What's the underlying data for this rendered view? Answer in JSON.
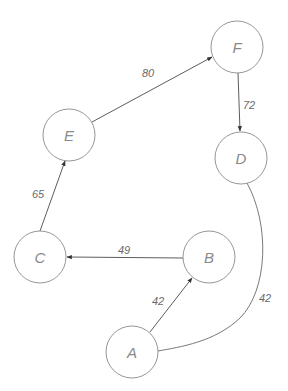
{
  "diagram": {
    "type": "weighted-graph",
    "nodes": [
      {
        "id": "A",
        "label": "A",
        "x": 132,
        "y": 352
      },
      {
        "id": "B",
        "label": "B",
        "x": 209,
        "y": 257
      },
      {
        "id": "C",
        "label": "C",
        "x": 40,
        "y": 257
      },
      {
        "id": "D",
        "label": "D",
        "x": 241,
        "y": 158
      },
      {
        "id": "E",
        "label": "E",
        "x": 69,
        "y": 135
      },
      {
        "id": "F",
        "label": "F",
        "x": 237,
        "y": 47
      }
    ],
    "edges": [
      {
        "from": "A",
        "to": "B",
        "weight": "42",
        "directed": true
      },
      {
        "from": "B",
        "to": "C",
        "weight": "49",
        "directed": true
      },
      {
        "from": "C",
        "to": "E",
        "weight": "65",
        "directed": true
      },
      {
        "from": "E",
        "to": "F",
        "weight": "80",
        "directed": true
      },
      {
        "from": "F",
        "to": "D",
        "weight": "72",
        "directed": true
      },
      {
        "from": "D",
        "to": "A",
        "weight": "42",
        "directed": false,
        "curved": true
      }
    ]
  },
  "labels": {
    "node_a": "A",
    "node_b": "B",
    "node_c": "C",
    "node_d": "D",
    "node_e": "E",
    "node_f": "F",
    "w_ab": "42",
    "w_bc": "49",
    "w_ce": "65",
    "w_ef": "80",
    "w_fd": "72",
    "w_da": "42"
  }
}
